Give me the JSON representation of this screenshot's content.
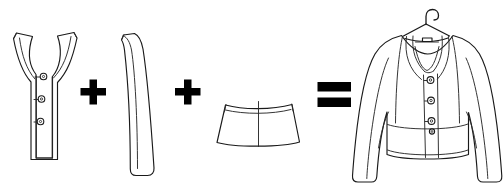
{
  "scene": {
    "title": "Jacket construction equation",
    "description": "Technical fashion flat illustration: bodice front with button placket plus sleeve plus peplum equals finished jacket on hanger",
    "background_color": "#ffffff",
    "line_color": "#1a1a1a",
    "fill_color": "#ffffff",
    "width": 504,
    "height": 193
  },
  "operators": [
    {
      "name": "plus-operator-1",
      "symbol": "+",
      "x": 85,
      "y": 93
    },
    {
      "name": "plus-operator-2",
      "symbol": "+",
      "x": 180,
      "y": 93
    },
    {
      "name": "equals-operator",
      "symbol": "=",
      "x": 334,
      "y": 95
    }
  ],
  "pieces": [
    {
      "id": "bodice-front",
      "label": "Bodice front with button placket",
      "index": 1,
      "button_count": 3,
      "buttons": [
        {
          "name": "placket-button-1",
          "cx": 43.5,
          "cy": 76.5
        },
        {
          "name": "placket-button-2",
          "cx": 41.5,
          "cy": 99.0
        },
        {
          "name": "placket-button-3",
          "cx": 40.5,
          "cy": 121.5
        }
      ]
    },
    {
      "id": "sleeve",
      "label": "Tapered two-piece sleeve",
      "index": 2,
      "button_count": 0,
      "buttons": []
    },
    {
      "id": "peplum",
      "label": "Peplum basque band with centre seam",
      "index": 3,
      "button_count": 0,
      "buttons": []
    },
    {
      "id": "finished-jacket",
      "label": "Finished jacket on hanger",
      "index": 4,
      "button_count": 4,
      "buttons": [
        {
          "name": "jacket-button-1",
          "cx": 430.5,
          "cy": 80.0
        },
        {
          "name": "jacket-button-2",
          "cx": 431.0,
          "cy": 100.5
        },
        {
          "name": "jacket-button-3",
          "cx": 431.5,
          "cy": 121.0
        },
        {
          "name": "jacket-button-4",
          "cx": 432.0,
          "cy": 131.5
        }
      ]
    }
  ],
  "hanger": {
    "name": "garment-hanger",
    "label": "Wire hanger hook"
  }
}
